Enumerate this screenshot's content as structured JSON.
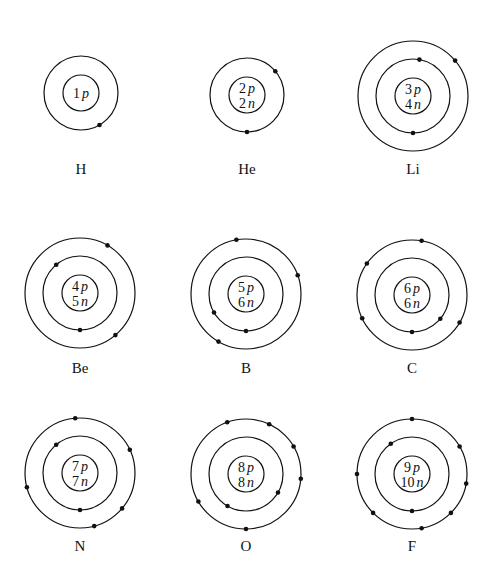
{
  "atoms": [
    {
      "symbol": "H",
      "protons": "1",
      "neutrons": null,
      "cx": 81,
      "cy": 93,
      "label_y": 174,
      "shells": [
        {
          "r": 37,
          "electron_angles": [
            60
          ]
        }
      ]
    },
    {
      "symbol": "He",
      "protons": "2",
      "neutrons": "2",
      "cx": 247,
      "cy": 95,
      "label_y": 174,
      "shells": [
        {
          "r": 37,
          "electron_angles": [
            90,
            -40
          ]
        }
      ]
    },
    {
      "symbol": "Li",
      "protons": "3",
      "neutrons": "4",
      "cx": 413,
      "cy": 96,
      "label_y": 174,
      "shells": [
        {
          "r": 37,
          "electron_angles": [
            90,
            -80
          ]
        },
        {
          "r": 55,
          "electron_angles": [
            -40
          ]
        }
      ]
    },
    {
      "symbol": "Be",
      "protons": "4",
      "neutrons": "5",
      "cx": 80,
      "cy": 293,
      "label_y": 373,
      "shells": [
        {
          "r": 37,
          "electron_angles": [
            90,
            -130
          ]
        },
        {
          "r": 55,
          "electron_angles": [
            -60,
            50
          ]
        }
      ]
    },
    {
      "symbol": "B",
      "protons": "5",
      "neutrons": "6",
      "cx": 246,
      "cy": 294,
      "label_y": 373,
      "shells": [
        {
          "r": 37,
          "electron_angles": [
            90,
            150
          ]
        },
        {
          "r": 55,
          "electron_angles": [
            -100,
            -20,
            120
          ]
        }
      ]
    },
    {
      "symbol": "C",
      "protons": "6",
      "neutrons": "6",
      "cx": 412,
      "cy": 295,
      "label_y": 373,
      "shells": [
        {
          "r": 37,
          "electron_angles": [
            90,
            40
          ]
        },
        {
          "r": 55,
          "electron_angles": [
            -80,
            -145,
            155,
            30
          ]
        }
      ]
    },
    {
      "symbol": "N",
      "protons": "7",
      "neutrons": "7",
      "cx": 80,
      "cy": 473,
      "label_y": 551,
      "shells": [
        {
          "r": 37,
          "electron_angles": [
            90,
            -130
          ]
        },
        {
          "r": 55,
          "electron_angles": [
            -95,
            -25,
            165,
            40,
            75
          ]
        }
      ]
    },
    {
      "symbol": "O",
      "protons": "8",
      "neutrons": "8",
      "cx": 246,
      "cy": 474,
      "label_y": 551,
      "shells": [
        {
          "r": 37,
          "electron_angles": [
            120,
            30
          ]
        },
        {
          "r": 55,
          "electron_angles": [
            -110,
            -65,
            -30,
            5,
            150,
            90
          ]
        }
      ]
    },
    {
      "symbol": "F",
      "protons": "9",
      "neutrons": "10",
      "cx": 412,
      "cy": 474,
      "label_y": 551,
      "shells": [
        {
          "r": 37,
          "electron_angles": [
            90,
            -125
          ]
        },
        {
          "r": 55,
          "electron_angles": [
            -90,
            -30,
            10,
            45,
            80,
            135,
            180
          ]
        }
      ]
    }
  ],
  "labels": {
    "nucleus_proton_suffix": "p",
    "nucleus_neutron_suffix": "n"
  },
  "colors": {
    "stroke": "#111111",
    "background": "#ffffff"
  }
}
